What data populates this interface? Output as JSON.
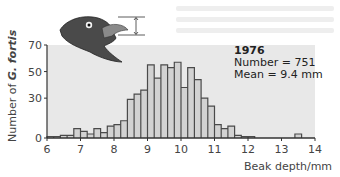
{
  "chart_data": {
    "type": "bar",
    "subtype": "histogram",
    "title": "",
    "legend": {
      "year": "1976",
      "number": "Number = 751",
      "mean": "Mean = 9.4 mm"
    },
    "xlabel": "Beak depth/mm",
    "ylabel_prefix": "Number of ",
    "ylabel_species": "G. fortis",
    "xlim": [
      6,
      14
    ],
    "ylim": [
      0,
      70
    ],
    "xticks": [
      "6",
      "7",
      "8",
      "9",
      "10",
      "11",
      "12",
      "13",
      "14"
    ],
    "yticks": [
      "0",
      "30",
      "50",
      "70"
    ],
    "bin_width": 0.2,
    "bins": [
      {
        "x0": 6.0,
        "x1": 6.2,
        "count": 1
      },
      {
        "x0": 6.2,
        "x1": 6.4,
        "count": 1
      },
      {
        "x0": 6.4,
        "x1": 6.6,
        "count": 2
      },
      {
        "x0": 6.6,
        "x1": 6.8,
        "count": 2
      },
      {
        "x0": 6.8,
        "x1": 7.0,
        "count": 7
      },
      {
        "x0": 7.0,
        "x1": 7.2,
        "count": 5
      },
      {
        "x0": 7.2,
        "x1": 7.4,
        "count": 3
      },
      {
        "x0": 7.4,
        "x1": 7.6,
        "count": 7
      },
      {
        "x0": 7.6,
        "x1": 7.8,
        "count": 4
      },
      {
        "x0": 7.8,
        "x1": 8.0,
        "count": 9
      },
      {
        "x0": 8.0,
        "x1": 8.2,
        "count": 10
      },
      {
        "x0": 8.2,
        "x1": 8.4,
        "count": 13
      },
      {
        "x0": 8.4,
        "x1": 8.6,
        "count": 29
      },
      {
        "x0": 8.6,
        "x1": 8.8,
        "count": 33
      },
      {
        "x0": 8.8,
        "x1": 9.0,
        "count": 36
      },
      {
        "x0": 9.0,
        "x1": 9.2,
        "count": 55
      },
      {
        "x0": 9.2,
        "x1": 9.4,
        "count": 45
      },
      {
        "x0": 9.4,
        "x1": 9.6,
        "count": 55
      },
      {
        "x0": 9.6,
        "x1": 9.8,
        "count": 53
      },
      {
        "x0": 9.8,
        "x1": 10.0,
        "count": 57
      },
      {
        "x0": 10.0,
        "x1": 10.2,
        "count": 38
      },
      {
        "x0": 10.2,
        "x1": 10.4,
        "count": 53
      },
      {
        "x0": 10.4,
        "x1": 10.6,
        "count": 44
      },
      {
        "x0": 10.6,
        "x1": 10.8,
        "count": 30
      },
      {
        "x0": 10.8,
        "x1": 11.0,
        "count": 24
      },
      {
        "x0": 11.0,
        "x1": 11.2,
        "count": 10
      },
      {
        "x0": 11.2,
        "x1": 11.4,
        "count": 7
      },
      {
        "x0": 11.4,
        "x1": 11.6,
        "count": 9
      },
      {
        "x0": 11.6,
        "x1": 11.8,
        "count": 2
      },
      {
        "x0": 11.8,
        "x1": 12.0,
        "count": 1
      },
      {
        "x0": 12.0,
        "x1": 12.2,
        "count": 1
      },
      {
        "x0": 13.4,
        "x1": 13.6,
        "count": 3
      }
    ],
    "grid": false,
    "colors": {
      "plot_background": "#e8e8e8",
      "bar_fill": "#d2d2d2",
      "bar_stroke": "#4a4a4a",
      "axis": "#333333"
    }
  },
  "illustration": {
    "name": "finch-head",
    "head_color": "#4a4a4a",
    "beak_color": "#8a8a8a"
  }
}
